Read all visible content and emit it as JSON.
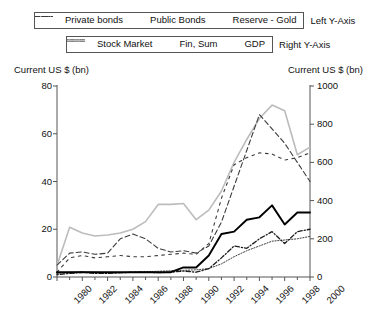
{
  "legend": {
    "row1": {
      "entries": [
        {
          "label": "Private bonds",
          "style": "dotted-fine",
          "color": "#3b3b3b",
          "icon": "line-style-dotted-icon"
        },
        {
          "label": "Public Bonds",
          "style": "dashed-sparse",
          "color": "#3b3b3b",
          "icon": "line-style-dash-sparse-icon"
        },
        {
          "label": "Reserve - Gold",
          "style": "dashed-long",
          "color": "#3b3b3b",
          "icon": "line-style-dash-long-icon"
        }
      ],
      "axis_side": "Left Y-Axis"
    },
    "row2": {
      "entries": [
        {
          "label": "Stock Market",
          "style": "dash-dot",
          "color": "#1c1c1c",
          "icon": "line-style-dash-dot-icon"
        },
        {
          "label": "Fin, Sum",
          "style": "solid-bold",
          "color": "#000000",
          "icon": "line-style-solid-icon"
        },
        {
          "label": "GDP",
          "style": "solid-light",
          "color": "#bcbcbc",
          "icon": "line-style-light-icon"
        }
      ],
      "axis_side": "Right Y-Axis"
    }
  },
  "axis_titles": {
    "left": "Current US $ (bn)",
    "right": "Current US $ (bn)"
  },
  "chart_data": {
    "type": "line",
    "title": "",
    "subtitle": "",
    "xlabel": "",
    "ylabel": "Current US $ (bn)",
    "y2label": "Current US $ (bn)",
    "grid": false,
    "legend_position": "top",
    "x": [
      1980,
      1981,
      1982,
      1983,
      1984,
      1985,
      1986,
      1987,
      1988,
      1989,
      1990,
      1991,
      1992,
      1993,
      1994,
      1995,
      1996,
      1997,
      1998,
      1999,
      2000
    ],
    "xlim": [
      1980,
      2000
    ],
    "xtick_labels": [
      "1980",
      "1982",
      "1984",
      "1986",
      "1988",
      "1990",
      "1992",
      "1994",
      "1996",
      "1998",
      "2000"
    ],
    "xtick_values": [
      1980,
      1982,
      1984,
      1986,
      1988,
      1990,
      1992,
      1994,
      1996,
      1998,
      2000
    ],
    "ylim": [
      0,
      80
    ],
    "ytick_labels": [
      "0",
      "20",
      "40",
      "60",
      "80"
    ],
    "ytick_values": [
      0,
      20,
      40,
      60,
      80
    ],
    "y2lim": [
      0,
      1000
    ],
    "y2tick_labels": [
      "0",
      "200",
      "400",
      "600",
      "800",
      "1000"
    ],
    "y2tick_values": [
      0,
      200,
      400,
      600,
      800,
      1000
    ],
    "series": [
      {
        "name": "Private bonds",
        "axis": "left",
        "style": "dotted-fine",
        "color": "#3b3b3b",
        "values": [
          1.5,
          2.0,
          2.2,
          2.0,
          1.8,
          1.8,
          2.0,
          2.2,
          2.4,
          2.6,
          2.8,
          3.0,
          3.5,
          5.5,
          8.5,
          11.0,
          13.0,
          15.0,
          15.5,
          16.0,
          17.0
        ]
      },
      {
        "name": "Public Bonds",
        "axis": "left",
        "style": "dashed-sparse",
        "color": "#3b3b3b",
        "values": [
          2.0,
          8.0,
          9.0,
          8.0,
          8.5,
          9.0,
          8.5,
          8.5,
          9.0,
          9.5,
          10.0,
          9.5,
          14.0,
          33.0,
          47.0,
          50.0,
          52.0,
          51.5,
          49.0,
          50.0,
          52.0
        ]
      },
      {
        "name": "Reserve - Gold",
        "axis": "left",
        "style": "dashed-long",
        "color": "#3b3b3b",
        "values": [
          5.0,
          10.0,
          10.5,
          9.5,
          10.0,
          16.0,
          18.0,
          16.0,
          12.0,
          10.5,
          11.0,
          10.0,
          13.0,
          23.0,
          38.0,
          53.0,
          68.0,
          62.0,
          56.0,
          48.0,
          40.0
        ]
      },
      {
        "name": "Stock Market",
        "axis": "left",
        "style": "dash-dot",
        "color": "#1c1c1c",
        "values": [
          1.0,
          1.5,
          2.0,
          1.5,
          1.5,
          1.8,
          2.0,
          2.0,
          1.8,
          2.0,
          2.5,
          2.0,
          3.5,
          8.0,
          13.0,
          12.0,
          16.0,
          19.0,
          14.0,
          19.0,
          20.0
        ]
      },
      {
        "name": "Fin, Sum",
        "axis": "left",
        "style": "solid-bold",
        "color": "#000000",
        "values": [
          2.0,
          2.0,
          2.0,
          2.0,
          2.0,
          2.0,
          2.0,
          2.0,
          2.0,
          2.0,
          4.0,
          4.0,
          9.0,
          18.0,
          19.0,
          24.0,
          25.0,
          30.0,
          22.0,
          27.0,
          27.0
        ]
      },
      {
        "name": "GDP",
        "axis": "right",
        "style": "solid-light",
        "color": "#bcbcbc",
        "values": [
          60,
          260,
          230,
          215,
          220,
          230,
          250,
          290,
          380,
          380,
          385,
          300,
          350,
          450,
          600,
          720,
          830,
          900,
          870,
          640,
          680
        ]
      }
    ]
  }
}
